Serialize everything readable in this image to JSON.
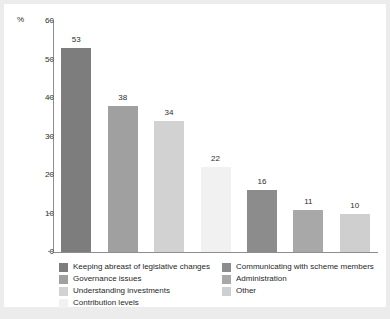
{
  "chart_data": {
    "type": "bar",
    "title": "",
    "xlabel": "",
    "ylabel": "%",
    "ylim": [
      0,
      60
    ],
    "ytick_labels": [
      "60",
      "50",
      "40",
      "30",
      "20",
      "10",
      "0"
    ],
    "ytick_values": [
      60,
      50,
      40,
      30,
      20,
      10,
      0
    ],
    "grid": false,
    "legend_position": "bottom",
    "categories": [
      "Keeping abreast of legislative changes",
      "Governance issues",
      "Understanding investments",
      "Contribution levels",
      "Communicating with scheme members",
      "Administration",
      "Other"
    ],
    "values": [
      53,
      38,
      34,
      22,
      16,
      11,
      10
    ],
    "value_labels": [
      "53",
      "38",
      "34",
      "22",
      "16",
      "11",
      "10"
    ],
    "colors": [
      "#7d7d7d",
      "#a0a0a0",
      "#d2d2d2",
      "#f1f1f1",
      "#8c8c8c",
      "#a8a8a8",
      "#cfcfcf"
    ]
  },
  "axis": {
    "y_title": "%"
  },
  "legend": {
    "left_column": [
      {
        "label": "Keeping abreast of legislative changes",
        "color": "#7d7d7d"
      },
      {
        "label": "Governance issues",
        "color": "#a0a0a0"
      },
      {
        "label": "Understanding investments",
        "color": "#d2d2d2"
      },
      {
        "label": "Contribution levels",
        "color": "#f1f1f1"
      }
    ],
    "right_column": [
      {
        "label": "Communicating with scheme members",
        "color": "#8c8c8c"
      },
      {
        "label": "Administration",
        "color": "#a8a8a8"
      },
      {
        "label": "Other",
        "color": "#cfcfcf"
      }
    ]
  },
  "theme": {
    "page_background": "#ececed",
    "figure_background": "#ffffff",
    "axis_color": "#8e8e8e",
    "text_color": "#2d2d2d"
  }
}
